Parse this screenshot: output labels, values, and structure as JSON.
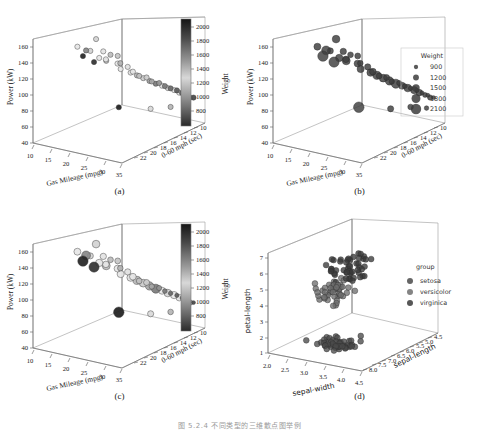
{
  "figure": {
    "footer_note": "图 5.2.4 不同类型的三维散点图举例",
    "panels": [
      {
        "id": "a",
        "caption": "(a)"
      },
      {
        "id": "b",
        "caption": "(b)"
      },
      {
        "id": "c",
        "caption": "(c)"
      },
      {
        "id": "d",
        "caption": "(d)"
      }
    ]
  },
  "chart_data": [
    {
      "id": "a",
      "type": "scatter",
      "title": "",
      "panel_label": "(a)",
      "encoding": {
        "x": "mpg",
        "y": "power",
        "z": "accel",
        "color": "weight",
        "size": "constant"
      },
      "xlabel": "Gas Mileage (mpg)",
      "ylabel": "Power (kW)",
      "zlabel": "0-60 mph (sec)",
      "xticks": [
        10,
        15,
        20,
        25,
        30,
        35
      ],
      "yticks": [
        40,
        60,
        80,
        100,
        120,
        140,
        160
      ],
      "zticks": [
        10,
        12,
        14,
        16,
        18,
        20,
        22
      ],
      "xlim": [
        7,
        37
      ],
      "ylim": [
        35,
        175
      ],
      "zlim": [
        8,
        23
      ],
      "grid": false,
      "colorbar": {
        "label": "Weight",
        "ticks": [
          800,
          1000,
          1200,
          1400,
          1600,
          1800,
          2000
        ],
        "vmin": 700,
        "vmax": 2150,
        "colormap": "gray-reversed-dark-top",
        "position": "right"
      },
      "points": [
        {
          "x": 18.0,
          "y": 165,
          "z": 13.5,
          "w": 1560
        },
        {
          "x": 14.5,
          "y": 157,
          "z": 12.0,
          "w": 1420
        },
        {
          "x": 16.5,
          "y": 152,
          "z": 12.5,
          "w": 1790
        },
        {
          "x": 17.0,
          "y": 150,
          "z": 13.0,
          "w": 1250
        },
        {
          "x": 19.5,
          "y": 148,
          "z": 14.0,
          "w": 1300
        },
        {
          "x": 16.0,
          "y": 145,
          "z": 12.2,
          "w": 2100
        },
        {
          "x": 21.0,
          "y": 143,
          "z": 14.5,
          "w": 1180
        },
        {
          "x": 22.5,
          "y": 141,
          "z": 15.0,
          "w": 1210
        },
        {
          "x": 18.5,
          "y": 139,
          "z": 13.8,
          "w": 1500
        },
        {
          "x": 20.0,
          "y": 137,
          "z": 14.2,
          "w": 1340
        },
        {
          "x": 17.5,
          "y": 134,
          "z": 13.4,
          "w": 2060
        },
        {
          "x": 19.0,
          "y": 132,
          "z": 14.8,
          "w": 1620
        },
        {
          "x": 23.0,
          "y": 131,
          "z": 15.2,
          "w": 1150
        },
        {
          "x": 21.5,
          "y": 128,
          "z": 15.5,
          "w": 1400
        },
        {
          "x": 24.0,
          "y": 124,
          "z": 16.0,
          "w": 1290
        },
        {
          "x": 22.0,
          "y": 120,
          "z": 15.8,
          "w": 1460
        },
        {
          "x": 25.0,
          "y": 117,
          "z": 16.4,
          "w": 1370
        },
        {
          "x": 23.5,
          "y": 113,
          "z": 16.8,
          "w": 1520
        },
        {
          "x": 26.0,
          "y": 110,
          "z": 17.0,
          "w": 1190
        },
        {
          "x": 24.5,
          "y": 108,
          "z": 17.4,
          "w": 1650
        },
        {
          "x": 27.0,
          "y": 106,
          "z": 17.8,
          "w": 1230
        },
        {
          "x": 25.5,
          "y": 103,
          "z": 18.0,
          "w": 1580
        },
        {
          "x": 28.0,
          "y": 100,
          "z": 18.2,
          "w": 1110
        },
        {
          "x": 26.5,
          "y": 98,
          "z": 18.6,
          "w": 1700
        },
        {
          "x": 29.0,
          "y": 96,
          "z": 19.0,
          "w": 1060
        },
        {
          "x": 27.5,
          "y": 93,
          "z": 19.2,
          "w": 1830
        },
        {
          "x": 30.0,
          "y": 91,
          "z": 19.5,
          "w": 980
        },
        {
          "x": 28.5,
          "y": 89,
          "z": 19.8,
          "w": 1440
        },
        {
          "x": 31.0,
          "y": 87,
          "z": 20.0,
          "w": 930
        },
        {
          "x": 29.5,
          "y": 85,
          "z": 20.3,
          "w": 1550
        },
        {
          "x": 32.0,
          "y": 83,
          "z": 20.6,
          "w": 890
        },
        {
          "x": 30.5,
          "y": 81,
          "z": 20.9,
          "w": 1480
        },
        {
          "x": 33.0,
          "y": 79,
          "z": 21.0,
          "w": 860
        },
        {
          "x": 31.5,
          "y": 77,
          "z": 21.3,
          "w": 1350
        },
        {
          "x": 34.0,
          "y": 75,
          "z": 21.5,
          "w": 840
        },
        {
          "x": 32.5,
          "y": 73,
          "z": 21.8,
          "w": 1020
        },
        {
          "x": 35.0,
          "y": 71,
          "z": 22.0,
          "w": 820
        },
        {
          "x": 33.5,
          "y": 69,
          "z": 22.2,
          "w": 1090
        },
        {
          "x": 21.0,
          "y": 67,
          "z": 16.0,
          "w": 2120
        },
        {
          "x": 28.0,
          "y": 64,
          "z": 18.0,
          "w": 1270
        },
        {
          "x": 31.0,
          "y": 62,
          "z": 20.0,
          "w": 1160
        },
        {
          "x": 34.5,
          "y": 60,
          "z": 21.0,
          "w": 950
        }
      ]
    },
    {
      "id": "b",
      "type": "scatter",
      "panel_label": "(b)",
      "encoding": {
        "x": "mpg",
        "y": "power",
        "z": "accel",
        "color": "constant",
        "size": "weight"
      },
      "xlabel": "Gas Mileage (mpg)",
      "ylabel": "Power (kW)",
      "zlabel": "0-60 mph (sec)",
      "xticks": [
        10,
        15,
        20,
        25,
        30,
        35
      ],
      "yticks": [
        40,
        60,
        80,
        100,
        120,
        140,
        160
      ],
      "zticks": [
        10,
        12,
        14,
        16,
        18,
        20,
        22
      ],
      "xlim": [
        7,
        37
      ],
      "ylim": [
        35,
        175
      ],
      "zlim": [
        8,
        23
      ],
      "grid": false,
      "marker_color": "#3d3d3d",
      "legend": {
        "title": "Weight",
        "position": "right",
        "entries": [
          {
            "label": "900",
            "size": 900
          },
          {
            "label": "1200",
            "size": 1200
          },
          {
            "label": "1500",
            "size": 1500
          },
          {
            "label": "1800",
            "size": 1800
          },
          {
            "label": "2100",
            "size": 2100
          }
        ]
      }
    },
    {
      "id": "c",
      "type": "scatter",
      "panel_label": "(c)",
      "encoding": {
        "x": "mpg",
        "y": "power",
        "z": "accel",
        "color": "weight",
        "size": "weight"
      },
      "xlabel": "Gas Mileage (mpg)",
      "ylabel": "Power (kW)",
      "zlabel": "0-60 mph (sec)",
      "xticks": [
        10,
        15,
        20,
        25,
        30,
        35
      ],
      "yticks": [
        40,
        60,
        80,
        100,
        120,
        140,
        160
      ],
      "zticks": [
        10,
        12,
        14,
        16,
        18,
        20,
        22
      ],
      "xlim": [
        7,
        37
      ],
      "ylim": [
        35,
        175
      ],
      "zlim": [
        8,
        23
      ],
      "grid": false,
      "colorbar": {
        "label": "Weight",
        "ticks": [
          800,
          1000,
          1200,
          1400,
          1600,
          1800,
          2000
        ],
        "vmin": 700,
        "vmax": 2150,
        "colormap": "gray-reversed-dark-top",
        "position": "right"
      }
    },
    {
      "id": "d",
      "type": "scatter",
      "panel_label": "(d)",
      "encoding": {
        "x": "sepal-width",
        "y": "petal-length",
        "z": "sepal-length",
        "color": "group"
      },
      "xlabel": "sepal-width",
      "ylabel": "petal-length",
      "zlabel": "sepal-length",
      "xticks": [
        2.0,
        2.5,
        3.0,
        3.5,
        4.0,
        4.5
      ],
      "yticks": [
        1,
        2,
        3,
        4,
        5,
        6,
        7
      ],
      "zticks": [
        4.5,
        5.0,
        5.5,
        6.0,
        6.5,
        7.0,
        7.5,
        8.0
      ],
      "xlim": [
        1.85,
        4.65
      ],
      "ylim": [
        0.6,
        7.6
      ],
      "zlim": [
        4.2,
        8.3
      ],
      "grid": false,
      "legend": {
        "title": "group",
        "position": "right",
        "entries": [
          {
            "label": "setosa",
            "color": "#4a4a4a"
          },
          {
            "label": "versicolor",
            "color": "#6e6e6e"
          },
          {
            "label": "virginica",
            "color": "#3a3a3a"
          }
        ]
      }
    }
  ]
}
